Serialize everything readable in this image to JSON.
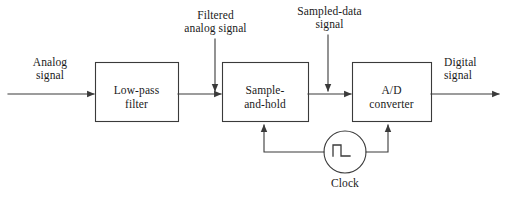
{
  "diagram": {
    "stroke_color": "#3a3a3a",
    "text_color": "#1a1a1a",
    "background_color": "#ffffff",
    "blocks": [
      {
        "id": "low-pass-filter",
        "line1": "Low-pass",
        "line2": "filter",
        "label": "Low-pass\nfilter"
      },
      {
        "id": "sample-and-hold",
        "line1": "Sample-",
        "line2": "and-hold",
        "label": "Sample-\nand-hold"
      },
      {
        "id": "ad-converter",
        "line1": "A/D",
        "line2": "converter",
        "label": "A/D\nconverter"
      }
    ],
    "signal_labels": [
      {
        "id": "analog-signal",
        "line1": "Analog",
        "line2": "signal",
        "label": "Analog\nsignal"
      },
      {
        "id": "filtered-analog-signal",
        "line1": "Filtered",
        "line2": "analog signal",
        "label": "Filtered\nanalog signal"
      },
      {
        "id": "sampled-data-signal",
        "line1": "Sampled-data",
        "line2": "signal",
        "label": "Sampled-data\nsignal"
      },
      {
        "id": "digital-signal",
        "line1": "Digital",
        "line2": "signal",
        "label": "Digital\nsignal"
      }
    ],
    "clock": {
      "id": "clock",
      "label": "Clock",
      "symbol": "square-wave"
    }
  }
}
